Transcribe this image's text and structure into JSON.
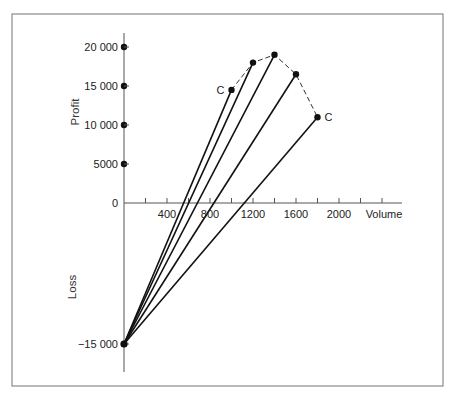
{
  "chart_data": {
    "type": "line",
    "title": "",
    "xlabel": "Volume",
    "ylabel_positive": "Profit",
    "ylabel_negative": "Loss",
    "x_ticks": [
      400,
      800,
      1200,
      1600,
      2000
    ],
    "x_minor_ticks": [
      200,
      400,
      600,
      800,
      1000,
      1200,
      1400,
      1600,
      1800,
      2000,
      2200,
      2400
    ],
    "y_ticks": [
      20000,
      15000,
      10000,
      5000,
      0,
      -15000
    ],
    "y_tick_labels": [
      "20 000",
      "15 000",
      "10 000",
      "5000",
      "0",
      "−15 000"
    ],
    "xlim": [
      0,
      2600
    ],
    "ylim": [
      -15000,
      22000
    ],
    "origin_point": {
      "x": 0,
      "y": -15000
    },
    "series": [
      {
        "name": "C (left)",
        "x": [
          0,
          1000
        ],
        "y": [
          -15000,
          14500
        ],
        "label": "C"
      },
      {
        "name": "Line 2",
        "x": [
          0,
          1200
        ],
        "y": [
          -15000,
          18000
        ]
      },
      {
        "name": "Line 3",
        "x": [
          0,
          1400
        ],
        "y": [
          -15000,
          19000
        ]
      },
      {
        "name": "Line 4",
        "x": [
          0,
          1600
        ],
        "y": [
          -15000,
          16500
        ]
      },
      {
        "name": "C (right)",
        "x": [
          0,
          1800
        ],
        "y": [
          -15000,
          11000
        ],
        "label": "C"
      }
    ],
    "envelope": {
      "style": "dashed",
      "points": [
        [
          1000,
          14500
        ],
        [
          1200,
          18000
        ],
        [
          1400,
          19000
        ],
        [
          1600,
          16500
        ],
        [
          1800,
          11000
        ]
      ]
    },
    "annotations": [
      "C",
      "C"
    ],
    "grid": false,
    "legend": "none"
  }
}
